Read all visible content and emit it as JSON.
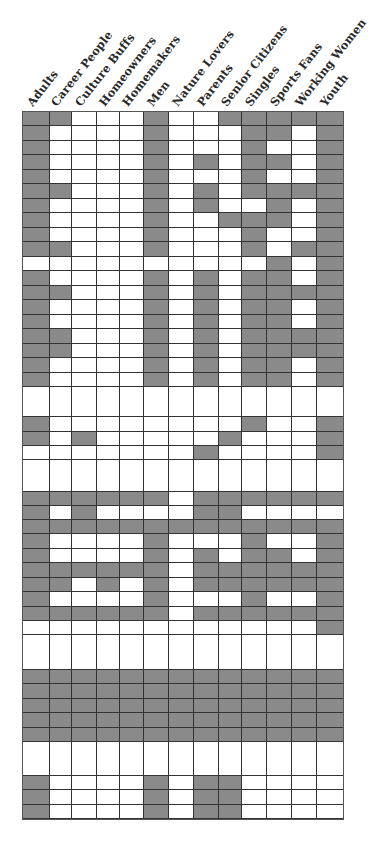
{
  "chart_data": {
    "type": "heatmap",
    "title": "",
    "columns": [
      "Adults",
      "Career People",
      "Culture Buffs",
      "Homeowners",
      "Homemakers",
      "Men",
      "Nature Lovers",
      "Parents",
      "Senior Citizens",
      "Singles",
      "Sports Fans",
      "Working Women",
      "Youth"
    ],
    "column_widths": [
      27,
      22,
      25,
      23,
      24,
      25,
      25,
      25,
      23,
      25,
      25,
      25,
      26
    ],
    "shade_color": "#8a8a8a",
    "empty_color": "#ffffff",
    "rows": [
      {
        "h": 14,
        "cells": [
          1,
          1,
          0,
          0,
          0,
          1,
          0,
          0,
          1,
          1,
          1,
          1,
          1
        ]
      },
      {
        "h": 15,
        "cells": [
          1,
          0,
          0,
          0,
          0,
          1,
          0,
          0,
          0,
          1,
          1,
          0,
          1
        ]
      },
      {
        "h": 14,
        "cells": [
          1,
          0,
          0,
          0,
          0,
          1,
          0,
          0,
          0,
          1,
          0,
          0,
          1
        ]
      },
      {
        "h": 15,
        "cells": [
          1,
          0,
          0,
          0,
          0,
          1,
          0,
          1,
          0,
          1,
          1,
          0,
          1
        ]
      },
      {
        "h": 14,
        "cells": [
          1,
          0,
          0,
          0,
          0,
          1,
          0,
          0,
          0,
          1,
          0,
          0,
          1
        ]
      },
      {
        "h": 15,
        "cells": [
          1,
          1,
          0,
          0,
          0,
          1,
          0,
          1,
          0,
          1,
          1,
          1,
          1
        ]
      },
      {
        "h": 14,
        "cells": [
          1,
          0,
          0,
          0,
          0,
          1,
          0,
          1,
          0,
          0,
          1,
          0,
          1
        ]
      },
      {
        "h": 15,
        "cells": [
          1,
          0,
          0,
          0,
          0,
          1,
          0,
          0,
          1,
          1,
          1,
          0,
          1
        ]
      },
      {
        "h": 14,
        "cells": [
          1,
          0,
          0,
          0,
          0,
          1,
          0,
          0,
          0,
          1,
          0,
          0,
          1
        ]
      },
      {
        "h": 15,
        "cells": [
          1,
          1,
          0,
          0,
          0,
          1,
          0,
          0,
          0,
          1,
          0,
          1,
          1
        ]
      },
      {
        "h": 14,
        "cells": [
          0,
          0,
          0,
          0,
          0,
          0,
          0,
          0,
          0,
          0,
          1,
          0,
          1
        ]
      },
      {
        "h": 15,
        "cells": [
          1,
          0,
          0,
          0,
          0,
          1,
          0,
          1,
          0,
          1,
          1,
          0,
          1
        ]
      },
      {
        "h": 14,
        "cells": [
          1,
          1,
          0,
          0,
          0,
          1,
          0,
          1,
          0,
          1,
          1,
          1,
          1
        ]
      },
      {
        "h": 15,
        "cells": [
          1,
          0,
          0,
          0,
          0,
          1,
          0,
          1,
          0,
          1,
          1,
          0,
          1
        ]
      },
      {
        "h": 14,
        "cells": [
          1,
          0,
          0,
          0,
          0,
          1,
          0,
          1,
          0,
          1,
          1,
          0,
          1
        ]
      },
      {
        "h": 15,
        "cells": [
          1,
          1,
          0,
          0,
          0,
          1,
          0,
          1,
          0,
          1,
          1,
          1,
          1
        ]
      },
      {
        "h": 14,
        "cells": [
          1,
          1,
          0,
          0,
          0,
          1,
          0,
          1,
          0,
          1,
          1,
          1,
          1
        ]
      },
      {
        "h": 15,
        "cells": [
          1,
          0,
          0,
          0,
          0,
          1,
          0,
          1,
          0,
          1,
          1,
          0,
          1
        ]
      },
      {
        "h": 14,
        "cells": [
          1,
          0,
          0,
          0,
          0,
          1,
          0,
          1,
          0,
          1,
          1,
          0,
          1
        ]
      },
      {
        "h": 30,
        "cells": [
          0,
          0,
          0,
          0,
          0,
          0,
          0,
          0,
          0,
          0,
          0,
          0,
          0
        ]
      },
      {
        "h": 15,
        "cells": [
          1,
          0,
          0,
          0,
          0,
          0,
          0,
          0,
          0,
          1,
          0,
          0,
          1
        ]
      },
      {
        "h": 14,
        "cells": [
          1,
          0,
          1,
          0,
          0,
          0,
          0,
          0,
          1,
          0,
          0,
          0,
          1
        ]
      },
      {
        "h": 14,
        "cells": [
          0,
          0,
          0,
          0,
          0,
          0,
          0,
          1,
          0,
          0,
          0,
          0,
          1
        ]
      },
      {
        "h": 32,
        "cells": [
          0,
          0,
          0,
          0,
          0,
          0,
          0,
          0,
          0,
          0,
          0,
          0,
          0
        ]
      },
      {
        "h": 14,
        "cells": [
          1,
          1,
          1,
          1,
          1,
          1,
          0,
          1,
          1,
          1,
          1,
          1,
          1
        ]
      },
      {
        "h": 14,
        "cells": [
          1,
          0,
          1,
          0,
          0,
          0,
          0,
          1,
          1,
          0,
          0,
          0,
          0
        ]
      },
      {
        "h": 14,
        "cells": [
          1,
          1,
          1,
          1,
          1,
          1,
          1,
          1,
          1,
          1,
          1,
          1,
          1
        ]
      },
      {
        "h": 15,
        "cells": [
          1,
          0,
          0,
          0,
          0,
          1,
          0,
          0,
          0,
          1,
          0,
          0,
          1
        ]
      },
      {
        "h": 14,
        "cells": [
          1,
          0,
          0,
          0,
          0,
          1,
          0,
          1,
          0,
          1,
          1,
          0,
          1
        ]
      },
      {
        "h": 15,
        "cells": [
          1,
          1,
          1,
          1,
          1,
          1,
          0,
          1,
          1,
          1,
          1,
          1,
          1
        ]
      },
      {
        "h": 14,
        "cells": [
          1,
          1,
          0,
          1,
          0,
          1,
          0,
          1,
          1,
          1,
          1,
          1,
          1
        ]
      },
      {
        "h": 15,
        "cells": [
          1,
          0,
          0,
          0,
          0,
          1,
          0,
          0,
          0,
          1,
          0,
          0,
          1
        ]
      },
      {
        "h": 14,
        "cells": [
          1,
          1,
          1,
          1,
          1,
          1,
          0,
          1,
          1,
          1,
          1,
          1,
          1
        ]
      },
      {
        "h": 14,
        "cells": [
          0,
          0,
          0,
          0,
          0,
          0,
          0,
          0,
          0,
          0,
          0,
          0,
          1
        ]
      },
      {
        "h": 35,
        "cells": [
          0,
          0,
          0,
          0,
          0,
          0,
          0,
          0,
          0,
          0,
          0,
          0,
          0
        ]
      },
      {
        "h": 14,
        "cells": [
          1,
          1,
          1,
          1,
          1,
          1,
          1,
          1,
          1,
          1,
          1,
          1,
          1
        ]
      },
      {
        "h": 15,
        "cells": [
          1,
          1,
          1,
          1,
          1,
          1,
          1,
          1,
          1,
          1,
          1,
          1,
          1
        ]
      },
      {
        "h": 14,
        "cells": [
          1,
          1,
          1,
          1,
          1,
          1,
          1,
          1,
          1,
          1,
          1,
          1,
          1
        ]
      },
      {
        "h": 15,
        "cells": [
          1,
          1,
          1,
          1,
          1,
          1,
          1,
          1,
          1,
          1,
          1,
          1,
          1
        ]
      },
      {
        "h": 14,
        "cells": [
          1,
          1,
          1,
          1,
          1,
          1,
          1,
          1,
          1,
          1,
          1,
          1,
          1
        ]
      },
      {
        "h": 34,
        "cells": [
          0,
          0,
          0,
          0,
          0,
          0,
          0,
          0,
          0,
          0,
          0,
          0,
          0
        ]
      },
      {
        "h": 14,
        "cells": [
          1,
          0,
          0,
          0,
          0,
          1,
          0,
          1,
          1,
          0,
          0,
          0,
          0
        ]
      },
      {
        "h": 15,
        "cells": [
          1,
          0,
          0,
          0,
          0,
          1,
          0,
          1,
          1,
          0,
          0,
          0,
          0
        ]
      },
      {
        "h": 14,
        "cells": [
          1,
          0,
          0,
          0,
          0,
          1,
          0,
          1,
          1,
          0,
          0,
          0,
          0
        ]
      }
    ]
  }
}
